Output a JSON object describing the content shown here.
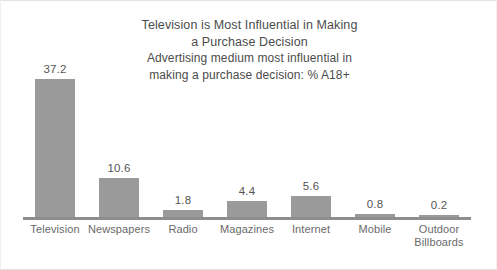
{
  "chart_data": {
    "type": "bar",
    "title": "Television is Most Influential in Making a Purchase Decision",
    "title_lines": [
      "Television is Most Influential in Making",
      "a Purchase Decision"
    ],
    "subtitle": "Advertising medium most influential in making a purchase decision: % A18+",
    "subtitle_lines": [
      "Advertising medium most influential in",
      "making a purchase decision: % A18+"
    ],
    "categories": [
      "Television",
      "Newspapers",
      "Radio",
      "Magazines",
      "Internet",
      "Mobile",
      "Outdoor Billboards"
    ],
    "category_label_lines": [
      [
        "Television"
      ],
      [
        "Newspapers"
      ],
      [
        "Radio"
      ],
      [
        "Magazines"
      ],
      [
        "Internet"
      ],
      [
        "Mobile"
      ],
      [
        "Outdoor",
        "Billboards"
      ]
    ],
    "values": [
      37.2,
      10.6,
      1.8,
      4.4,
      5.6,
      0.8,
      0.2
    ],
    "value_labels": [
      "37.2",
      "10.6",
      "1.8",
      "4.4",
      "5.6",
      "0.8",
      "0.2"
    ],
    "xlabel": "",
    "ylabel": "",
    "ylim": [
      0,
      37.2
    ],
    "grid": false,
    "legend": false,
    "axis_ticks_visible": false,
    "bar_color": "#9a9a9a",
    "axis_color": "#8e8e8e",
    "text_color": "#4c4c4c",
    "label_color": "#6a6a6a",
    "background_color": "#ffffff"
  }
}
